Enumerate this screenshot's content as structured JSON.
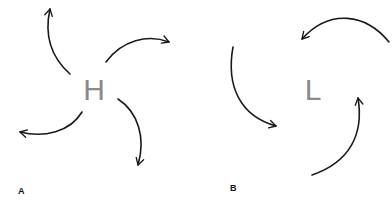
{
  "panels": [
    {
      "id": "A",
      "label": "A",
      "center_symbol": "H",
      "meaning": "high pressure",
      "flow": "outward, clockwise"
    },
    {
      "id": "B",
      "label": "B",
      "center_symbol": "L",
      "meaning": "low pressure",
      "flow": "inward, counterclockwise"
    }
  ],
  "colors": {
    "center_letter": "#8a8a8a",
    "arrow": "#1a1a1a",
    "label": "#111111",
    "background": "#ffffff"
  }
}
